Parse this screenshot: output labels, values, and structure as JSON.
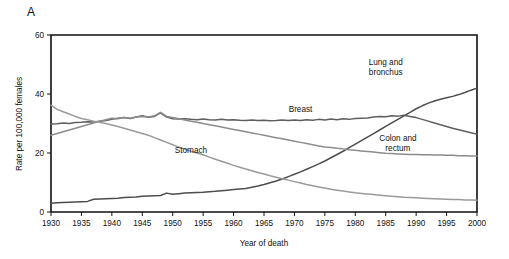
{
  "panel": {
    "letter": "A"
  },
  "chart_data": {
    "type": "line",
    "title": "",
    "xlabel": "Year of death",
    "ylabel": "Rate per 100,000 females",
    "xlim": [
      1930,
      2000
    ],
    "ylim": [
      0,
      60
    ],
    "yticks": [
      0,
      20,
      40,
      60
    ],
    "ytick_labels": [
      "0",
      "20",
      "40",
      "60"
    ],
    "xticks": [
      1930,
      1935,
      1940,
      1945,
      1950,
      1955,
      1960,
      1965,
      1970,
      1975,
      1980,
      1985,
      1990,
      1995,
      2000
    ],
    "xtick_labels": [
      "1930",
      "1935",
      "1940",
      "1945",
      "1950",
      "1955",
      "1960",
      "1965",
      "1970",
      "1975",
      "1980",
      "1985",
      "1990",
      "1995",
      "2000"
    ],
    "grid": false,
    "legend": "inline-annotations",
    "x": [
      1930,
      1931,
      1932,
      1933,
      1934,
      1935,
      1936,
      1937,
      1938,
      1939,
      1940,
      1941,
      1942,
      1943,
      1944,
      1945,
      1946,
      1947,
      1948,
      1949,
      1950,
      1951,
      1952,
      1953,
      1954,
      1955,
      1956,
      1957,
      1958,
      1959,
      1960,
      1961,
      1962,
      1963,
      1964,
      1965,
      1966,
      1967,
      1968,
      1969,
      1970,
      1971,
      1972,
      1973,
      1974,
      1975,
      1976,
      1977,
      1978,
      1979,
      1980,
      1981,
      1982,
      1983,
      1984,
      1985,
      1986,
      1987,
      1988,
      1989,
      1990,
      1991,
      1992,
      1993,
      1994,
      1995,
      1996,
      1997,
      1998,
      1999,
      2000
    ],
    "series": [
      {
        "name": "Lung and bronchus",
        "color": "#4d4d4d",
        "label_x": 1985,
        "label_y": 50,
        "values": [
          3.0,
          3.1,
          3.2,
          3.3,
          3.4,
          3.5,
          3.6,
          4.3,
          4.4,
          4.5,
          4.6,
          4.7,
          4.9,
          5.0,
          5.1,
          5.3,
          5.4,
          5.5,
          5.6,
          6.4,
          6.0,
          6.2,
          6.4,
          6.5,
          6.6,
          6.7,
          6.9,
          7.0,
          7.2,
          7.4,
          7.6,
          7.8,
          8.0,
          8.4,
          8.8,
          9.3,
          9.9,
          10.5,
          11.2,
          12.0,
          12.8,
          13.6,
          14.5,
          15.4,
          16.3,
          17.3,
          18.4,
          19.5,
          20.6,
          21.8,
          23.0,
          24.2,
          25.4,
          26.6,
          27.8,
          29.0,
          30.2,
          31.4,
          32.6,
          33.8,
          35.0,
          36.0,
          36.9,
          37.6,
          38.2,
          38.7,
          39.2,
          39.8,
          40.5,
          41.3,
          42.0
        ]
      },
      {
        "name": "Breast",
        "color": "#5e5e5e",
        "label_x": 1971,
        "label_y": 34,
        "values": [
          29.8,
          29.9,
          30.2,
          30.0,
          30.3,
          30.4,
          30.6,
          30.5,
          30.8,
          31.0,
          31.4,
          31.8,
          32.0,
          31.7,
          32.2,
          32.6,
          32.1,
          32.4,
          33.6,
          32.2,
          31.6,
          31.5,
          31.6,
          31.4,
          31.3,
          31.5,
          31.3,
          31.2,
          31.4,
          31.2,
          31.3,
          31.1,
          31.0,
          31.2,
          31.0,
          31.1,
          30.9,
          31.0,
          31.2,
          31.0,
          31.2,
          31.0,
          31.3,
          31.1,
          31.4,
          31.2,
          31.5,
          31.3,
          31.6,
          31.4,
          31.7,
          31.8,
          31.9,
          32.2,
          32.4,
          32.3,
          32.6,
          32.5,
          32.8,
          32.4,
          32.0,
          31.4,
          30.8,
          30.2,
          29.6,
          29.0,
          28.4,
          27.9,
          27.4,
          26.9,
          26.4
        ]
      },
      {
        "name": "Colon and rectum",
        "color": "#8c8c8c",
        "label_x": 1987,
        "label_y": 24,
        "values": [
          26.0,
          26.6,
          27.2,
          27.8,
          28.4,
          29.0,
          29.6,
          30.2,
          30.8,
          31.3,
          31.8,
          31.6,
          32.0,
          31.8,
          32.2,
          32.4,
          32.2,
          32.6,
          33.8,
          32.4,
          32.0,
          31.6,
          31.2,
          30.8,
          30.4,
          30.0,
          29.6,
          29.2,
          28.8,
          28.4,
          28.0,
          27.6,
          27.2,
          26.8,
          26.4,
          26.0,
          25.6,
          25.2,
          24.8,
          24.4,
          24.0,
          23.6,
          23.2,
          22.8,
          22.4,
          22.0,
          21.9,
          21.6,
          21.4,
          21.1,
          20.9,
          20.7,
          20.5,
          20.3,
          20.1,
          19.9,
          19.8,
          19.7,
          19.6,
          19.5,
          19.5,
          19.4,
          19.4,
          19.3,
          19.3,
          19.2,
          19.2,
          19.1,
          19.1,
          19.0,
          19.0
        ]
      },
      {
        "name": "Stomach",
        "color": "#9a9a9a",
        "label_x": 1953,
        "label_y": 20,
        "values": [
          36.2,
          34.8,
          34.0,
          33.2,
          32.4,
          31.7,
          31.3,
          30.8,
          30.4,
          30.0,
          29.5,
          29.0,
          28.4,
          27.8,
          27.2,
          26.6,
          26.0,
          25.2,
          24.4,
          23.6,
          22.8,
          22.0,
          21.3,
          20.6,
          20.0,
          19.4,
          18.6,
          17.9,
          17.2,
          16.5,
          15.8,
          15.2,
          14.6,
          14.0,
          13.4,
          12.9,
          12.3,
          11.8,
          11.3,
          10.8,
          10.3,
          9.8,
          9.3,
          8.9,
          8.5,
          8.1,
          7.7,
          7.4,
          7.1,
          6.8,
          6.5,
          6.3,
          6.1,
          5.9,
          5.7,
          5.5,
          5.3,
          5.2,
          5.0,
          4.9,
          4.8,
          4.7,
          4.6,
          4.5,
          4.4,
          4.3,
          4.2,
          4.2,
          4.1,
          4.1,
          4.0
        ]
      }
    ]
  }
}
